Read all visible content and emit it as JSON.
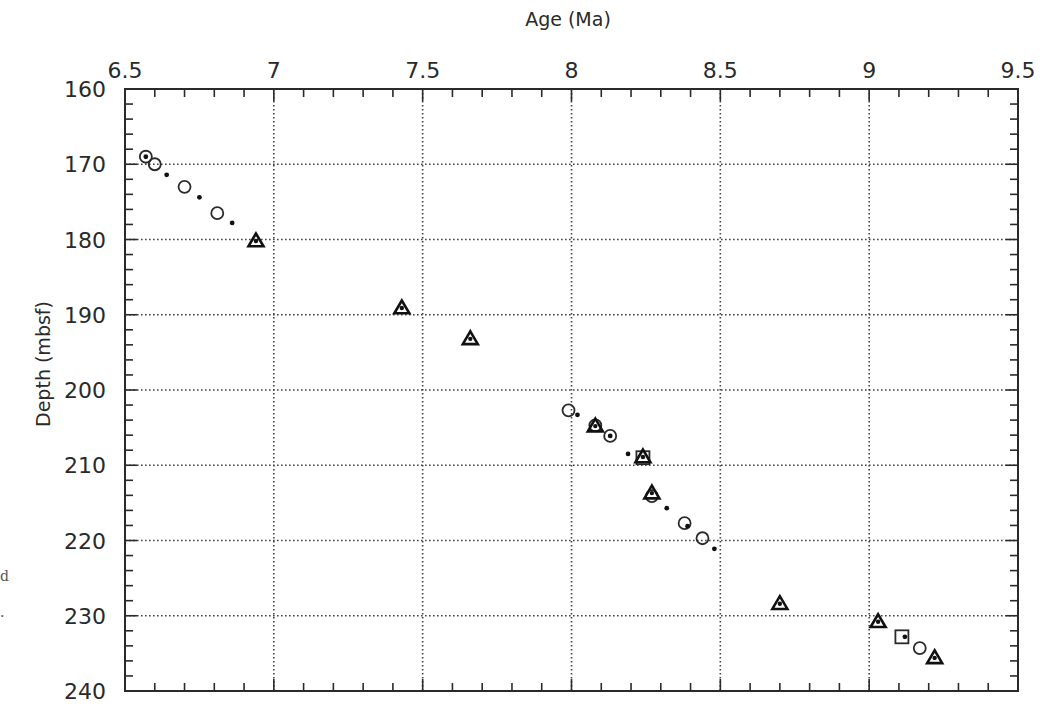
{
  "chart_data": {
    "type": "scatter",
    "title": "",
    "xlabel": "Age (Ma)",
    "ylabel": "Depth (mbsf)",
    "xlim": [
      6.5,
      9.5
    ],
    "ylim": [
      240,
      160
    ],
    "y_inverted": true,
    "x_axis_position": "top",
    "xticks": [
      6.5,
      7,
      7.5,
      8,
      8.5,
      9,
      9.5
    ],
    "xtick_labels": [
      "6.5",
      "7",
      "7.5",
      "8",
      "8.5",
      "9",
      "9.5"
    ],
    "yticks": [
      160,
      170,
      180,
      190,
      200,
      210,
      220,
      230,
      240
    ],
    "ytick_labels": [
      "160",
      "170",
      "180",
      "190",
      "200",
      "210",
      "220",
      "230",
      "240"
    ],
    "x_minor_step": 0.1,
    "y_minor_step": 2,
    "grid": true,
    "grid_style": "dotted",
    "legend": null,
    "series": [
      {
        "name": "open-circle",
        "marker": "circle-open",
        "points": [
          [
            6.57,
            169.0
          ],
          [
            6.6,
            170.0
          ],
          [
            6.7,
            173.0
          ],
          [
            6.81,
            176.5
          ],
          [
            7.99,
            202.7
          ],
          [
            8.08,
            204.7
          ],
          [
            8.13,
            206.1
          ],
          [
            8.27,
            214.1
          ],
          [
            8.38,
            217.7
          ],
          [
            8.44,
            219.7
          ],
          [
            9.17,
            234.3
          ]
        ]
      },
      {
        "name": "small-dot",
        "marker": "dot",
        "points": [
          [
            6.57,
            169.0
          ],
          [
            6.64,
            171.4
          ],
          [
            6.75,
            174.4
          ],
          [
            6.86,
            177.8
          ],
          [
            8.02,
            203.3
          ],
          [
            8.13,
            206.1
          ],
          [
            8.19,
            208.5
          ],
          [
            8.32,
            215.7
          ],
          [
            8.39,
            218.1
          ],
          [
            8.48,
            221.1
          ],
          [
            9.12,
            232.8
          ]
        ]
      },
      {
        "name": "filled-triangle",
        "marker": "triangle",
        "points": [
          [
            6.94,
            180.2
          ],
          [
            7.43,
            189.1
          ],
          [
            7.66,
            193.2
          ],
          [
            8.08,
            204.8
          ],
          [
            8.24,
            208.9
          ],
          [
            8.27,
            213.7
          ],
          [
            8.7,
            228.4
          ],
          [
            9.03,
            230.8
          ],
          [
            9.22,
            235.6
          ]
        ]
      },
      {
        "name": "open-square",
        "marker": "square-open",
        "points": [
          [
            8.24,
            209.0
          ],
          [
            9.11,
            232.8
          ]
        ]
      }
    ]
  },
  "page": {
    "stray_marks": [
      "d",
      "."
    ]
  }
}
